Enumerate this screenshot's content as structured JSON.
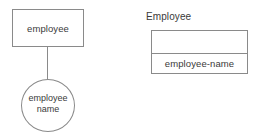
{
  "diagram": {
    "background_color": "#ffffff",
    "stroke_color": "#8a8a8a",
    "text_color": "#3a3a3a",
    "er_model": {
      "entity": {
        "label": "employee"
      },
      "attribute": {
        "label_line_1": "employee",
        "label_line_2": "name"
      }
    },
    "table_model": {
      "caption": "Employee",
      "header_row": {
        "value": ""
      },
      "rows": [
        {
          "value": "employee-name"
        }
      ]
    }
  }
}
